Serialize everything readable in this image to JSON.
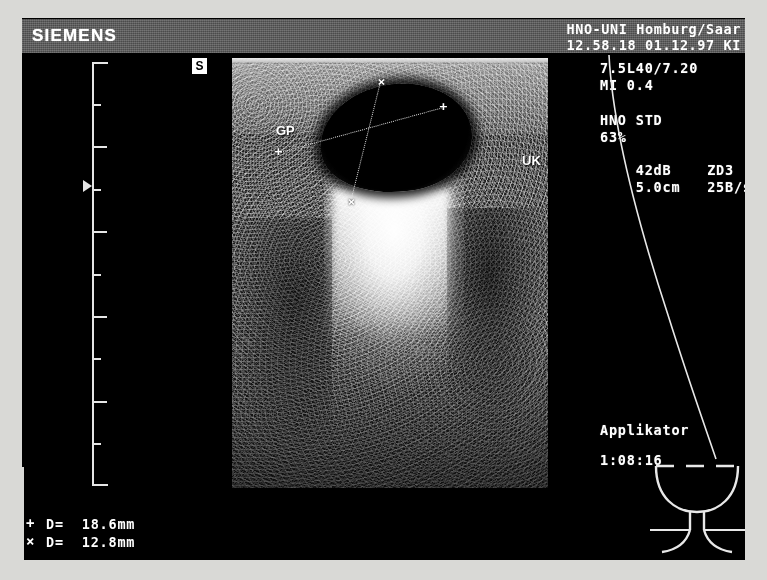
{
  "device": {
    "vendor": "SIEMENS",
    "banner_color": "#5a5a5a"
  },
  "header": {
    "institution": "HNO-UNI Homburg/Saar",
    "timestamp": "12.58.18 01.12.97 KI"
  },
  "scan_parameters": {
    "transducer": "7.5L40/7.20",
    "mechanical_index": "MI 0.4",
    "preset": "HNO STD",
    "gain": "63%",
    "dynamic_range": "42dB",
    "map": "ZD3",
    "depth": "5.0cm",
    "frame_rate": "25B/s",
    "orientation_marker": "S"
  },
  "image_annotations": {
    "label_left": "GP",
    "label_right": "UK"
  },
  "applicator": {
    "label": "Applikator",
    "timer": "1:08:16"
  },
  "measurements": [
    {
      "glyph": "+",
      "icon": "plus-caliper-icon",
      "text": "D=  18.6mm"
    },
    {
      "glyph": "×",
      "icon": "cross-caliper-icon",
      "text": "D=  12.8mm"
    }
  ],
  "calipers": {
    "pair_a": {
      "marker": "+",
      "p1": [
        46,
        92
      ],
      "p2": [
        210,
        47
      ]
    },
    "pair_b": {
      "marker": "×",
      "p1": [
        148,
        22
      ],
      "p2": [
        118,
        142
      ]
    }
  },
  "depth_scale": {
    "ticks": [
      0,
      42,
      84,
      127,
      169,
      212,
      254,
      296,
      339,
      381,
      424
    ],
    "focal_zone_y": 124,
    "unit": "cm"
  }
}
